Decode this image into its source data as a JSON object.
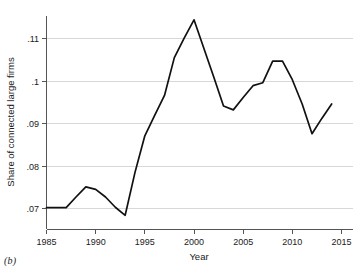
{
  "caption": "(b)",
  "chart_data": {
    "type": "line",
    "title": "",
    "xlabel": "Year",
    "ylabel": "Share of connected large firms",
    "xlim": [
      1985,
      2015
    ],
    "ylim": [
      0.0665,
      0.1165
    ],
    "grid": "horizontal",
    "legend": "none",
    "xticks": [
      1985,
      1990,
      1995,
      2000,
      2005,
      2010,
      2015
    ],
    "xtick_labels": [
      "1985",
      "1990",
      "1995",
      "2000",
      "2005",
      "2010",
      "2015"
    ],
    "yticks": [
      0.07,
      0.08,
      0.09,
      0.1,
      0.11
    ],
    "ytick_labels": [
      ".07",
      ".08",
      ".09",
      ".1",
      ".11"
    ],
    "line_color": "#111111",
    "grid_color": "#c8c8c8",
    "x": [
      1985,
      1986,
      1987,
      1988,
      1989,
      1990,
      1991,
      1992,
      1993,
      1994,
      1995,
      1996,
      1997,
      1998,
      1999,
      2000,
      2001,
      2002,
      2003,
      2004,
      2005,
      2006,
      2007,
      2008,
      2009,
      2010,
      2011,
      2012,
      2013,
      2014
    ],
    "values": [
      0.0702,
      0.0702,
      0.0702,
      0.0727,
      0.0751,
      0.0745,
      0.0727,
      0.0703,
      0.0684,
      0.0785,
      0.0871,
      0.0919,
      0.0966,
      0.1055,
      0.1101,
      0.1144,
      0.1077,
      0.101,
      0.0941,
      0.0932,
      0.0961,
      0.0989,
      0.0996,
      0.1047,
      0.1047,
      0.1003,
      0.0946,
      0.0876,
      0.0912,
      0.0946
    ],
    "series": [
      {
        "name": "Share of connected large firms",
        "values": [
          0.0702,
          0.0702,
          0.0702,
          0.0727,
          0.0751,
          0.0745,
          0.0727,
          0.0703,
          0.0684,
          0.0785,
          0.0871,
          0.0919,
          0.0966,
          0.1055,
          0.1101,
          0.1144,
          0.1077,
          0.101,
          0.0941,
          0.0932,
          0.0961,
          0.0989,
          0.0996,
          0.1047,
          0.1047,
          0.1003,
          0.0946,
          0.0876,
          0.0912,
          0.0946
        ]
      }
    ]
  }
}
